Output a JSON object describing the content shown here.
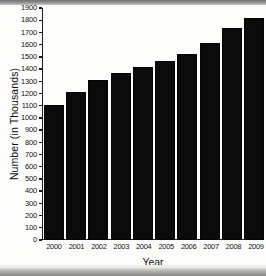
{
  "chart_data": {
    "type": "bar",
    "title": "",
    "xlabel": "Year",
    "ylabel": "Number (in Thousands)",
    "categories": [
      "2000",
      "2001",
      "2002",
      "2003",
      "2004",
      "2005",
      "2006",
      "2007",
      "2008",
      "2009"
    ],
    "values": [
      1105,
      1215,
      1310,
      1365,
      1415,
      1470,
      1525,
      1615,
      1740,
      1820
    ],
    "ylim": [
      0,
      1900
    ],
    "ytick_step": 100,
    "yticks": [
      0,
      100,
      200,
      300,
      400,
      500,
      600,
      700,
      800,
      900,
      1000,
      1100,
      1200,
      1300,
      1400,
      1500,
      1600,
      1700,
      1800,
      1900
    ],
    "ytick_labels": [
      "0",
      "100",
      "200",
      "300",
      "400",
      "500",
      "600",
      "700",
      "800",
      "900",
      "1000",
      "1100",
      "1200",
      "1300",
      "1400",
      "1500",
      "1600",
      "1700",
      "1800",
      "1900"
    ],
    "grid": false,
    "legend": false,
    "bar_color": "#0b0b0b",
    "axis_color": "#1a1a1a",
    "background_color": "#fdfdfc"
  }
}
